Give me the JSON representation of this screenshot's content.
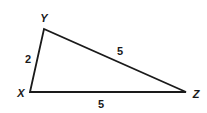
{
  "diagram": {
    "type": "triangle",
    "stroke_color": "#1a1a1a",
    "background": "#ffffff",
    "vertices": [
      {
        "name": "X",
        "x": 30,
        "y": 92,
        "label_x": 21,
        "label_y": 97
      },
      {
        "name": "Y",
        "x": 44,
        "y": 29,
        "label_x": 44,
        "label_y": 22
      },
      {
        "name": "Z",
        "x": 186,
        "y": 92,
        "label_x": 195,
        "label_y": 98
      }
    ],
    "sides": [
      {
        "from": "X",
        "to": "Y",
        "length_label": "2",
        "label_x": 28,
        "label_y": 63
      },
      {
        "from": "Y",
        "to": "Z",
        "length_label": "5",
        "label_x": 120,
        "label_y": 55
      },
      {
        "from": "X",
        "to": "Z",
        "length_label": "5",
        "label_x": 101,
        "label_y": 108
      }
    ]
  }
}
